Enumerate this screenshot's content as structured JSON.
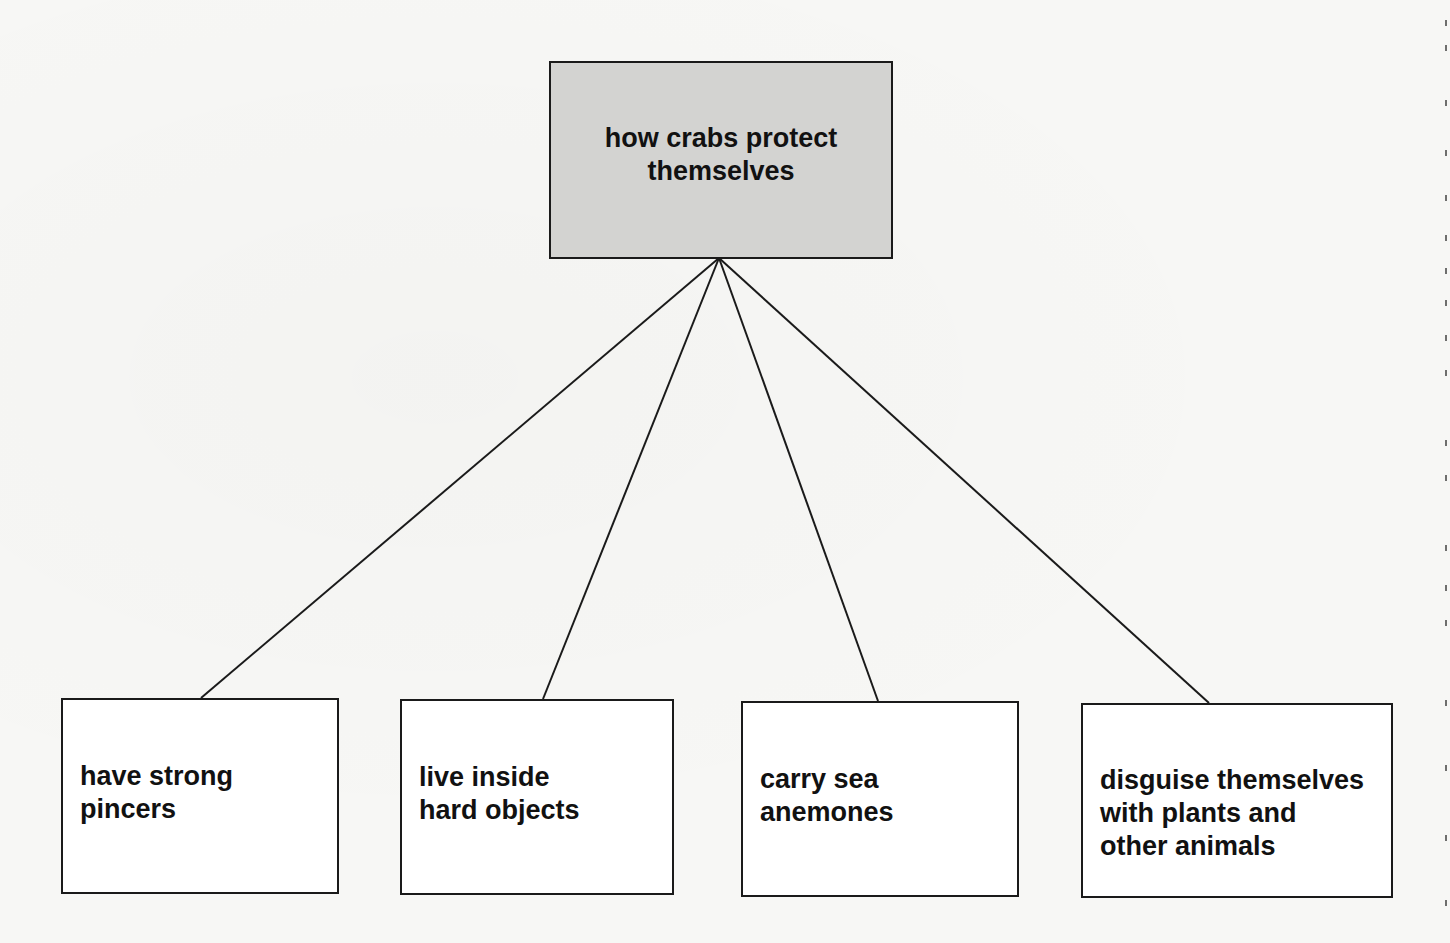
{
  "diagram": {
    "type": "concept-map",
    "root": {
      "label": "how crabs protect\nthemselves",
      "fill": "#d3d3d1",
      "box": {
        "x": 549,
        "y": 61,
        "w": 344,
        "h": 197
      }
    },
    "children": [
      {
        "label": "have strong\npincers",
        "box": {
          "x": 61,
          "y": 698,
          "w": 277,
          "h": 195
        },
        "anchor": {
          "x": 201,
          "y": 698
        }
      },
      {
        "label": "live inside\nhard objects",
        "box": {
          "x": 400,
          "y": 699,
          "w": 273,
          "h": 195
        },
        "anchor": {
          "x": 543,
          "y": 699
        }
      },
      {
        "label": "carry sea\nanemones",
        "box": {
          "x": 741,
          "y": 701,
          "w": 277,
          "h": 195
        },
        "anchor": {
          "x": 878,
          "y": 701
        }
      },
      {
        "label": "disguise themselves\nwith plants and\nother animals",
        "box": {
          "x": 1081,
          "y": 703,
          "w": 311,
          "h": 194
        },
        "anchor": {
          "x": 1209,
          "y": 703
        }
      }
    ],
    "hub": {
      "x": 719,
      "y": 258
    },
    "line_color": "#1a1a1a"
  }
}
